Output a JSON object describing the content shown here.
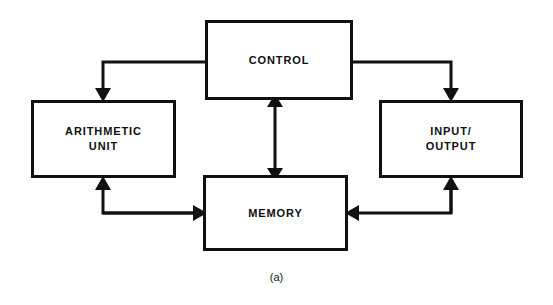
{
  "figure": {
    "caption": "(a)",
    "title": "",
    "background_color": "#ffffff",
    "line_color": "#111111",
    "text_color": "#101010"
  },
  "nodes": [
    {
      "id": "control",
      "label": "CONTROL",
      "name": "control-unit-box"
    },
    {
      "id": "arithmetic",
      "label": "ARITHMETIC\nUNIT",
      "name": "arithmetic-unit-box"
    },
    {
      "id": "io",
      "label": "INPUT/\nOUTPUT",
      "name": "input-output-box"
    },
    {
      "id": "memory",
      "label": "MEMORY",
      "name": "memory-box"
    }
  ],
  "connections": [
    {
      "id": "control-to-arithmetic",
      "from": "control",
      "to": "arithmetic",
      "direction": "one-way",
      "route": "left-then-down"
    },
    {
      "id": "control-to-io",
      "from": "control",
      "to": "io",
      "direction": "one-way",
      "route": "right-then-down"
    },
    {
      "id": "control-memory",
      "from": "control",
      "to": "memory",
      "direction": "two-way",
      "route": "vertical"
    },
    {
      "id": "memory-to-arithmetic",
      "from": "memory",
      "to": "arithmetic",
      "direction": "one-way",
      "route": "left-then-up"
    },
    {
      "id": "arithmetic-to-memory",
      "from": "arithmetic",
      "to": "memory",
      "direction": "one-way",
      "route": "down-then-right"
    },
    {
      "id": "io-to-memory",
      "from": "io",
      "to": "memory",
      "direction": "one-way",
      "route": "down-then-left"
    },
    {
      "id": "memory-to-io",
      "from": "memory",
      "to": "io",
      "direction": "one-way",
      "route": "right-then-up"
    }
  ]
}
